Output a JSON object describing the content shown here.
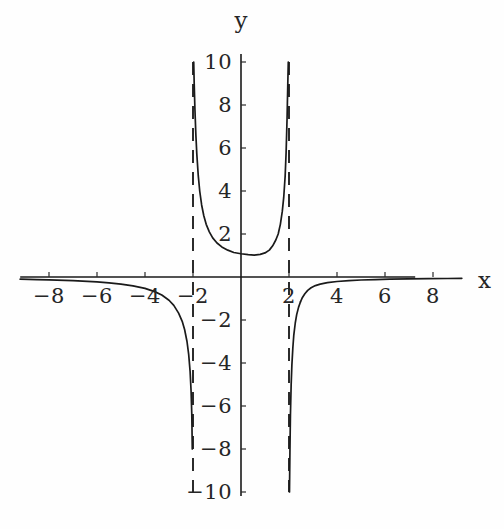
{
  "figure": {
    "background_color": "#fefefe",
    "curve_color": "#1a1a1a",
    "axis_color": "#1a1a1a",
    "asymptote_color": "#2b2b2b",
    "axis_labels": {
      "x": "x",
      "y": "y"
    }
  },
  "chart_data": {
    "type": "line",
    "title": "",
    "subtitle": "",
    "xlabel": "x",
    "ylabel": "y",
    "xlim": [
      -9.2,
      9.2
    ],
    "ylim": [
      -10,
      10
    ],
    "grid": false,
    "legend": null,
    "x_ticks": [
      -8,
      -6,
      -4,
      -2,
      2,
      4,
      6,
      8
    ],
    "x_tick_labels": [
      "-8",
      "-6",
      "-4",
      "-2",
      "2",
      "4",
      "6",
      "8"
    ],
    "y_ticks": [
      -10,
      -8,
      -6,
      -4,
      -2,
      2,
      4,
      6,
      8,
      10
    ],
    "y_tick_labels": [
      "-10",
      "-8",
      "-6",
      "-4",
      "-2",
      "2",
      "4",
      "6",
      "8",
      "10"
    ],
    "annotations": [
      {
        "type": "vertical-asymptote",
        "x": -2,
        "style": "dashed"
      },
      {
        "type": "vertical-asymptote",
        "x": 2,
        "style": "dashed"
      },
      {
        "type": "horizontal-asymptote",
        "y": 0,
        "style": "implicit"
      }
    ],
    "series": [
      {
        "name": "left-branch",
        "comment": "x < -2, approaches y=0 from below as x decreases, falls to -inf at x=-2",
        "x": [
          -9.2,
          -8.5,
          -8.0,
          -7.0,
          -6.0,
          -5.5,
          -5.0,
          -4.5,
          -4.0,
          -3.6,
          -3.3,
          -3.0,
          -2.8,
          -2.6,
          -2.45,
          -2.35,
          -2.25,
          -2.18,
          -2.12,
          -2.08,
          -2.05,
          -2.03
        ],
        "y": [
          -0.1,
          -0.12,
          -0.13,
          -0.17,
          -0.23,
          -0.27,
          -0.33,
          -0.41,
          -0.53,
          -0.68,
          -0.84,
          -1.08,
          -1.32,
          -1.68,
          -2.06,
          -2.44,
          -3.0,
          -3.6,
          -4.4,
          -5.3,
          -6.4,
          -8.0
        ]
      },
      {
        "name": "middle-branch",
        "comment": "-2 < x < 2, minimum near y=1 around x=0.5, rises to +inf at both asymptotes",
        "x": [
          -1.97,
          -1.95,
          -1.92,
          -1.88,
          -1.84,
          -1.78,
          -1.72,
          -1.64,
          -1.55,
          -1.45,
          -1.32,
          -1.18,
          -1.0,
          -0.8,
          -0.55,
          -0.3,
          0.0,
          0.3,
          0.55,
          0.8,
          1.0,
          1.18,
          1.32,
          1.45,
          1.55,
          1.64,
          1.72,
          1.78,
          1.84,
          1.88,
          1.92,
          1.95,
          1.97
        ],
        "y": [
          10.0,
          9.0,
          7.8,
          6.6,
          5.7,
          4.7,
          4.0,
          3.35,
          2.85,
          2.45,
          2.1,
          1.82,
          1.58,
          1.4,
          1.25,
          1.14,
          1.08,
          1.04,
          1.02,
          1.05,
          1.12,
          1.25,
          1.45,
          1.72,
          2.0,
          2.45,
          3.05,
          3.7,
          4.7,
          5.8,
          7.4,
          9.0,
          10.0
        ]
      },
      {
        "name": "right-branch-lower",
        "comment": "just right of x=2, descends to -inf hugging the asymptote",
        "x": [
          2.02,
          2.04,
          2.06,
          2.09,
          2.12,
          2.16,
          2.2,
          2.26,
          2.32,
          2.4,
          2.48
        ],
        "y": [
          -10.0,
          -8.0,
          -6.4,
          -5.0,
          -4.1,
          -3.3,
          -2.7,
          -2.15,
          -1.75,
          -1.4,
          -1.15
        ]
      },
      {
        "name": "right-branch-upper",
        "comment": "x > 2, comes up from the asymptote and flattens to y=0 from above",
        "x": [
          2.48,
          2.56,
          2.66,
          2.78,
          2.92,
          3.1,
          3.3,
          3.6,
          4.0,
          4.5,
          5.0,
          5.6,
          6.2,
          7.0,
          7.8,
          8.6,
          9.2
        ],
        "y": [
          -1.15,
          -0.95,
          -0.78,
          -0.62,
          -0.5,
          -0.4,
          -0.33,
          -0.26,
          -0.21,
          -0.17,
          -0.14,
          -0.12,
          -0.1,
          -0.09,
          -0.08,
          -0.07,
          -0.06
        ]
      }
    ]
  }
}
